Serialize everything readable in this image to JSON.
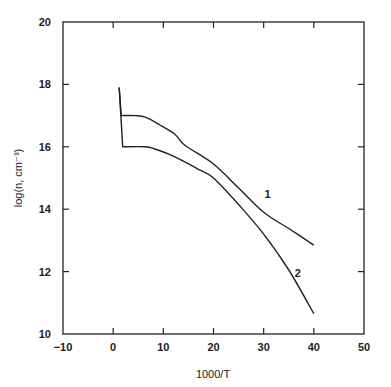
{
  "chart_data": {
    "type": "line",
    "title": "",
    "xlabel": "1000/T",
    "ylabel": "log(n, cm⁻³)",
    "xlim": [
      -10,
      50
    ],
    "ylim": [
      10,
      20
    ],
    "xticks": [
      -10,
      0,
      10,
      20,
      30,
      40,
      50
    ],
    "yticks": [
      10,
      12,
      14,
      16,
      18,
      20
    ],
    "xtick_labels": [
      "−10",
      "0",
      "10",
      "20",
      "30",
      "40",
      "50"
    ],
    "ytick_labels": [
      "10",
      "12",
      "14",
      "16",
      "18",
      "20"
    ],
    "grid": false,
    "legend": "none",
    "series": [
      {
        "name": "1",
        "label_at": [
          30.8,
          14.5
        ],
        "x": [
          1.2,
          1.6,
          4.4,
          6.4,
          9.3,
          12.3,
          14.3,
          20,
          25,
          30,
          35,
          40
        ],
        "y": [
          17.9,
          17.0,
          17.0,
          16.95,
          16.7,
          16.4,
          16.05,
          15.45,
          14.68,
          13.9,
          13.38,
          12.85
        ]
      },
      {
        "name": "2",
        "label_at": [
          36.8,
          11.95
        ],
        "x": [
          1.2,
          1.9,
          6.4,
          8.3,
          11.3,
          13.3,
          17,
          20,
          25,
          30,
          35,
          40
        ],
        "y": [
          17.9,
          16.0,
          16.0,
          15.93,
          15.75,
          15.6,
          15.28,
          15.0,
          14.15,
          13.2,
          12.05,
          10.65
        ]
      }
    ]
  }
}
